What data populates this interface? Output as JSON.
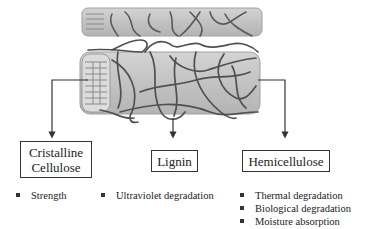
{
  "diagram": {
    "components": [
      {
        "id": "cellulose",
        "label_line1": "Cristalline",
        "label_line2": "Cellulose",
        "properties": [
          "Strength"
        ]
      },
      {
        "id": "lignin",
        "label": "Lignin",
        "properties": [
          "Ultraviolet degradation"
        ]
      },
      {
        "id": "hemicellulose",
        "label": "Hemicellulose",
        "properties": [
          "Thermal degradation",
          "Biological degradation",
          "Moisture absorption"
        ]
      }
    ],
    "colors": {
      "fiber_fill": "#c4c4c4",
      "fiber_edge": "#9a9a9a",
      "chain": "#555555",
      "connector": "#333333"
    }
  }
}
